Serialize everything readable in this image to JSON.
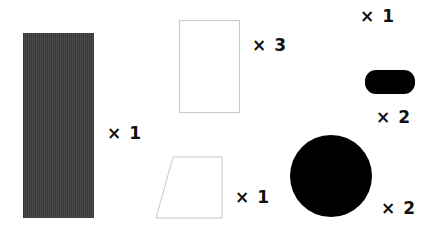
{
  "diagram": {
    "background": "#ffffff",
    "items": [
      {
        "shape": "tall-rectangle",
        "fill": "#3c3c3c",
        "label": "× 1"
      },
      {
        "shape": "outlined-rectangle",
        "fill": "#ffffff",
        "stroke": "#cccccc",
        "label": "× 3"
      },
      {
        "shape": "none",
        "label": "× 1"
      },
      {
        "shape": "rounded-pill",
        "fill": "#000000",
        "label": "× 2"
      },
      {
        "shape": "outlined-trapezoid",
        "fill": "#ffffff",
        "stroke": "#cccccc",
        "label": "× 1"
      },
      {
        "shape": "circle",
        "fill": "#000000",
        "label": "× 2"
      }
    ]
  }
}
